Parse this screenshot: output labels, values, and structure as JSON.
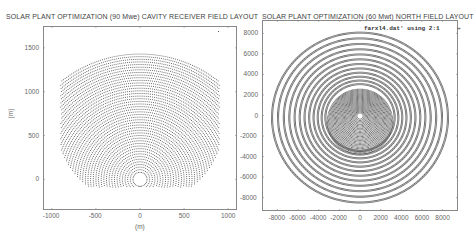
{
  "chart_data": [
    {
      "type": "scatter",
      "title": "SOLAR PLANT OPTIMIZATION (90 Mwe)   CAVITY RECEIVER FIELD LAYOUT",
      "xlabel": "(m)",
      "ylabel": "(m)",
      "xlim": [
        -1100,
        1100
      ],
      "ylim": [
        -350,
        1750
      ],
      "xticks": [
        -1000,
        -500,
        0,
        500,
        1000
      ],
      "yticks": [
        0,
        500,
        1000,
        1500
      ],
      "grid": false,
      "legend": null,
      "description": "Heliostat positions arranged in concentric arc rows north of a central cavity receiver at (0,0); field spans roughly x=-900..900, y=-80..1450 with an empty circle around the tower.",
      "series": [
        {
          "name": "heliostats",
          "shape": "arc-rows",
          "center": [
            0,
            0
          ],
          "r_min": 80,
          "r_max": 1450,
          "row_spacing": 30,
          "half_angle_deg_at_rmax": 38,
          "half_angle_deg_at_rmin": 180,
          "marker_color": "#555555"
        }
      ]
    },
    {
      "type": "scatter",
      "title": "SOLAR PLANT OPTIMIZATION (60 Mwt)   NORTH FIELD LAYOUT",
      "xlabel": "",
      "ylabel": "",
      "xlim": [
        -9500,
        9500
      ],
      "ylim": [
        -9300,
        9300
      ],
      "xticks": [
        -8000,
        -6000,
        -4000,
        -2000,
        0,
        2000,
        4000,
        6000,
        8000
      ],
      "yticks": [
        -8000,
        -6000,
        -4000,
        -2000,
        0,
        2000,
        4000,
        6000,
        8000
      ],
      "grid": false,
      "legend": {
        "label": "farxl4.dat' using 2:1",
        "position": "top-right",
        "marker": "+"
      },
      "description": "Heliostat positions in concentric circular rings about a tower at the origin; outer ring radius ~8800; dense core within ~3000 of center.",
      "series": [
        {
          "name": "farxl4.dat' using 2:1",
          "shape": "rings",
          "center": [
            0,
            0
          ],
          "r_min": 300,
          "r_max": 8800,
          "ring_count_outer": 14,
          "marker_color": "#555555"
        }
      ]
    }
  ],
  "plots": [
    {
      "title": "SOLAR PLANT OPTIMIZATION (90 Mwe)   CAVITY RECEIVER FIELD LAYOUT",
      "xlabel": "(m)",
      "ylabel": "(m)",
      "xtick_labels": [
        "-1000",
        "-500",
        "0",
        "500",
        "1000"
      ],
      "ytick_labels": [
        "0",
        "500",
        "1000",
        "1500"
      ]
    },
    {
      "title": "SOLAR PLANT OPTIMIZATION (60 Mwt)   NORTH FIELD LAYOUT",
      "legend": "farxl4.dat' using 2:1",
      "xtick_labels": [
        "-8000",
        "-6000",
        "-4000",
        "-2000",
        "0",
        "2000",
        "4000",
        "6000",
        "8000"
      ],
      "ytick_labels": [
        "8000",
        "6000",
        "4000",
        "2000",
        "0",
        "-2000",
        "-4000",
        "-6000",
        "-8000"
      ]
    }
  ],
  "colors": {
    "marker": "#555555",
    "frame": "#888888",
    "text": "#555555"
  }
}
